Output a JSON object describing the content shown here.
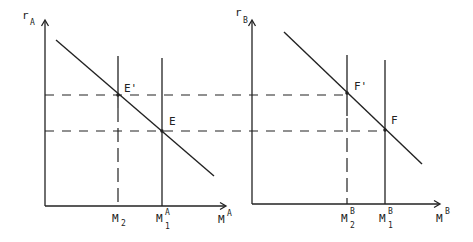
{
  "diagram": {
    "panel_a": {
      "y_axis_label": "r",
      "y_axis_sub": "A",
      "x_axis_label": "M",
      "x_axis_sup": "A",
      "tick_m2_label": "M",
      "tick_m2_sub": "2",
      "tick_m1_label": "M",
      "tick_m1_sub": "1",
      "tick_m1_sup": "A",
      "point_upper": "E'",
      "point_lower": "E"
    },
    "panel_b": {
      "y_axis_label": "r",
      "y_axis_sub": "B",
      "x_axis_label": "M",
      "x_axis_sup": "B",
      "tick_m2_label": "M",
      "tick_m2_sub": "2",
      "tick_m2_sup": "B",
      "tick_m1_label": "M",
      "tick_m1_sub": "1",
      "tick_m1_sup": "B",
      "point_upper": "F'",
      "point_lower": "F"
    }
  }
}
